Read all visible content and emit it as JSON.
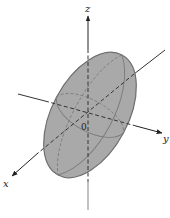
{
  "figure": {
    "type": "3d-ellipsoid",
    "axes": {
      "x_label": "x",
      "y_label": "y",
      "z_label": "z",
      "origin_label": "0"
    },
    "colors": {
      "surface_fill": "#a9a9a9",
      "surface_outline": "#6e6e6e",
      "axis": "#333333",
      "hidden_line": "#444444",
      "background": "#ffffff"
    }
  }
}
